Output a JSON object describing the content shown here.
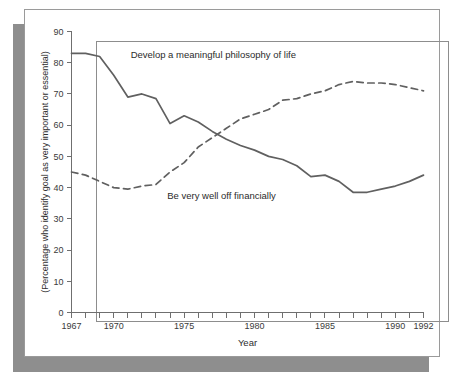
{
  "figure": {
    "card_background": "#ffffff",
    "shadow_color": "#8e8e8e",
    "border_color": "#9a9a9a",
    "caption_fragment": ""
  },
  "chart_data": {
    "type": "line",
    "title": "",
    "xlabel": "Year",
    "ylabel": "(Percentage who identify goal as very important or essential)",
    "xlim": [
      1967,
      1992
    ],
    "ylim": [
      0,
      90
    ],
    "grid": false,
    "legend": "inline-annotations",
    "y_ticks": [
      0,
      10,
      20,
      30,
      40,
      50,
      60,
      70,
      80,
      90
    ],
    "y_tick_labels": [
      "0",
      "10",
      "20",
      "30",
      "40",
      "50",
      "60",
      "70",
      "80",
      "90"
    ],
    "x_ticks": [
      1967,
      1968,
      1969,
      1970,
      1971,
      1972,
      1973,
      1974,
      1975,
      1976,
      1977,
      1978,
      1979,
      1980,
      1981,
      1982,
      1983,
      1984,
      1985,
      1986,
      1987,
      1988,
      1989,
      1990,
      1991,
      1992
    ],
    "x_tick_labels_shown": [
      "1967",
      "1970",
      "1975",
      "1980",
      "1985",
      "1990",
      "1992"
    ],
    "x_tick_labels_shown_at": [
      1967,
      1970,
      1975,
      1980,
      1985,
      1990,
      1992
    ],
    "x": [
      1967,
      1968,
      1969,
      1970,
      1971,
      1972,
      1973,
      1974,
      1975,
      1976,
      1977,
      1978,
      1979,
      1980,
      1981,
      1982,
      1983,
      1984,
      1985,
      1986,
      1987,
      1988,
      1989,
      1990,
      1991,
      1992
    ],
    "series": [
      {
        "name": "Develop a meaningful philosophy of life",
        "style": "solid",
        "color": "#606060",
        "label_x": 1971.2,
        "label_y": 81.5,
        "values": [
          83,
          83,
          82,
          76,
          69,
          70,
          68.5,
          60.5,
          63,
          61,
          58,
          55.5,
          53.5,
          52,
          50,
          49,
          47,
          43.5,
          44,
          42,
          38.5,
          38.5,
          39.5,
          40.5,
          42,
          44
        ]
      },
      {
        "name": "Be very well off financially",
        "style": "dashed",
        "color": "#606060",
        "label_x": 1973.8,
        "label_y": 36.5,
        "values": [
          45,
          44,
          42,
          40,
          39.5,
          40.5,
          41,
          45,
          48,
          53,
          56,
          59,
          62,
          63.5,
          65,
          68,
          68.5,
          70,
          71,
          73,
          74,
          73.5,
          73.5,
          73,
          72,
          71
        ]
      }
    ],
    "annotations": [
      {
        "text": "Develop a meaningful philosophy of life",
        "series": 0
      },
      {
        "text": "Be very well off financially",
        "series": 1
      }
    ]
  }
}
